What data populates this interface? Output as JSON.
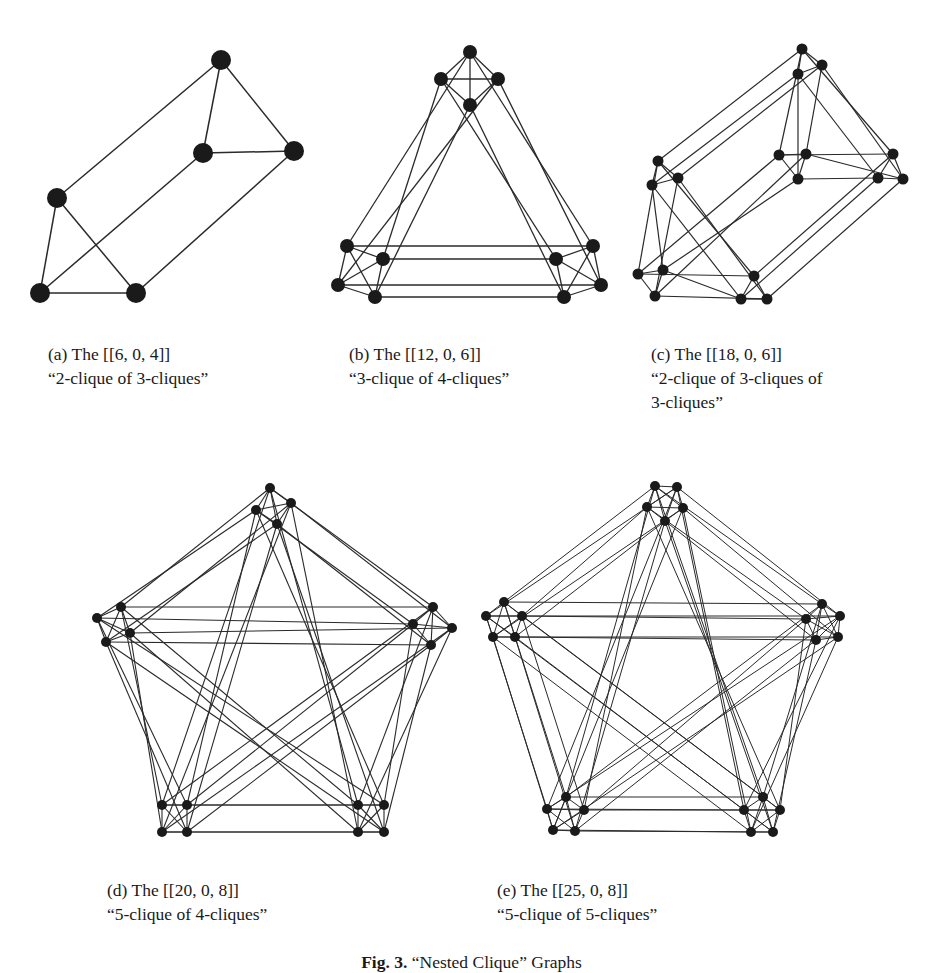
{
  "figure": {
    "label": "Fig. 3.",
    "title": "“Nested Clique” Graphs"
  },
  "subfigures": [
    {
      "id": "a",
      "label": "(a) The [[6, 0, 4]]",
      "description": "“2-clique of 3-cliques”",
      "description_cont": "",
      "code": [
        6,
        0,
        4
      ],
      "structure": "2-clique of 3-cliques"
    },
    {
      "id": "b",
      "label": "(b) The [[12, 0, 6]]",
      "description": "“3-clique of 4-cliques”",
      "description_cont": "",
      "code": [
        12,
        0,
        6
      ],
      "structure": "3-clique of 4-cliques"
    },
    {
      "id": "c",
      "label": "(c) The [[18, 0, 6]]",
      "description": "“2-clique of 3-cliques of",
      "description_cont": "3-cliques”",
      "code": [
        18,
        0,
        6
      ],
      "structure": "2-clique of 3-cliques of 3-cliques"
    },
    {
      "id": "d",
      "label": "(d) The [[20, 0, 8]]",
      "description": "“5-clique of 4-cliques”",
      "description_cont": "",
      "code": [
        20,
        0,
        8
      ],
      "structure": "5-clique of 4-cliques"
    },
    {
      "id": "e",
      "label": "(e) The [[25, 0, 8]]",
      "description": "“5-clique of 5-cliques”",
      "description_cont": "",
      "code": [
        25,
        0,
        8
      ],
      "structure": "5-clique of 5-cliques"
    }
  ],
  "colors": {
    "node": "#1a1a1a",
    "edge": "#2a2a2a"
  }
}
